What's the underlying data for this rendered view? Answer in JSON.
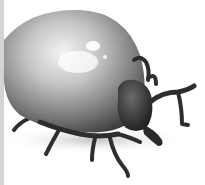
{
  "image": {
    "subject": "engorged tick illustration",
    "colors": {
      "background": "#ffffff",
      "body_highlight": "#f2f2f2",
      "body_mid": "#9a9a9a",
      "body_dark": "#3a3a3a",
      "legs": "#2e2e2e",
      "left_edge": "#d4d4d4"
    }
  }
}
